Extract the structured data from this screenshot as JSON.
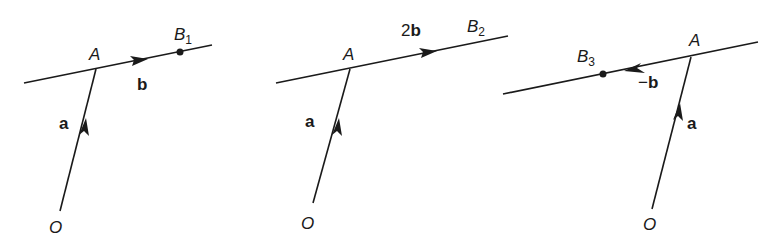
{
  "figure": {
    "stroke_color": "#1a1a1a",
    "panels": [
      {
        "id": "panel-1",
        "labels": {
          "A": "A",
          "O": "O",
          "a": "a",
          "b": "b",
          "B": "B",
          "B_sub": "1"
        },
        "description": "Vector b from A to B1"
      },
      {
        "id": "panel-2",
        "labels": {
          "A": "A",
          "O": "O",
          "a": "a",
          "b": "2b",
          "b_coef": "2",
          "b_vec": "b",
          "B": "B",
          "B_sub": "2"
        },
        "description": "Vector 2b from A to B2"
      },
      {
        "id": "panel-3",
        "labels": {
          "A": "A",
          "O": "O",
          "a": "a",
          "b": "-b",
          "b_sign": "−",
          "b_vec": "b",
          "B": "B",
          "B_sub": "3"
        },
        "description": "Vector -b from A to B3"
      }
    ]
  }
}
